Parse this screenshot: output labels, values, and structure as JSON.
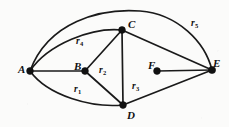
{
  "figure": {
    "type": "planar-graph-diagram",
    "background_color": "#fbfbfa",
    "ink_color": "#111111",
    "width": 229,
    "height": 127
  },
  "vertices": [
    {
      "id": "A",
      "label": "A",
      "x": 30,
      "y": 71,
      "label_x": 18,
      "label_y": 64
    },
    {
      "id": "B",
      "label": "B",
      "x": 85,
      "y": 71,
      "label_x": 74,
      "label_y": 61
    },
    {
      "id": "C",
      "label": "C",
      "x": 122,
      "y": 30,
      "label_x": 128,
      "label_y": 19
    },
    {
      "id": "D",
      "label": "D",
      "x": 123,
      "y": 105,
      "label_x": 127,
      "label_y": 110
    },
    {
      "id": "E",
      "label": "E",
      "x": 212,
      "y": 70,
      "label_x": 213,
      "label_y": 58
    },
    {
      "id": "F",
      "label": "F",
      "x": 157,
      "y": 71,
      "label_x": 148,
      "label_y": 60
    }
  ],
  "edges": [
    {
      "from": "A",
      "to": "B",
      "shape": "straight"
    },
    {
      "from": "A",
      "to": "E",
      "shape": "arc-over-top"
    },
    {
      "from": "A",
      "to": "C",
      "shape": "arc-upper"
    },
    {
      "from": "A",
      "to": "D",
      "shape": "arc-lower"
    },
    {
      "from": "B",
      "to": "C",
      "shape": "straight"
    },
    {
      "from": "B",
      "to": "D",
      "shape": "straight"
    },
    {
      "from": "C",
      "to": "D",
      "shape": "straight"
    },
    {
      "from": "C",
      "to": "E",
      "shape": "straight"
    },
    {
      "from": "D",
      "to": "E",
      "shape": "straight"
    },
    {
      "from": "F",
      "to": "E",
      "shape": "straight"
    }
  ],
  "region_labels": [
    {
      "id": "r1",
      "base": "r",
      "sub": "1",
      "x": 74,
      "y": 85
    },
    {
      "id": "r2",
      "base": "r",
      "sub": "2",
      "x": 99,
      "y": 66
    },
    {
      "id": "r3",
      "base": "r",
      "sub": "3",
      "x": 132,
      "y": 82
    },
    {
      "id": "r4",
      "base": "r",
      "sub": "4",
      "x": 76,
      "y": 37
    },
    {
      "id": "r5",
      "base": "r",
      "sub": "5",
      "x": 191,
      "y": 19
    }
  ]
}
